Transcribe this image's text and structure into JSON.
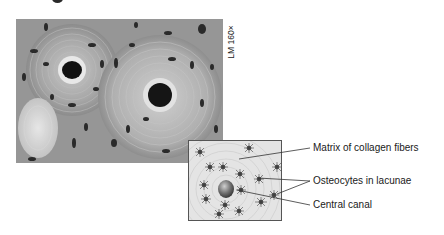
{
  "figure": {
    "micrograph": {
      "magnification_label": "LM 160×",
      "description": "light micrograph of compact bone showing osteons"
    },
    "inset": {
      "description": "diagram of osteon with central canal and osteocytes"
    },
    "labels": [
      {
        "text": "Matrix of collagen fibers",
        "x": 313,
        "y": 142
      },
      {
        "text": "Osteocytes in lacunae",
        "x": 313,
        "y": 175
      },
      {
        "text": "Central canal",
        "x": 313,
        "y": 199
      }
    ],
    "colors": {
      "background": "#ffffff",
      "micrograph_tone": "#9a9a9a",
      "inset_fill": "#e4e4e4",
      "leader_line": "#333333",
      "text": "#1a1a1a"
    }
  }
}
